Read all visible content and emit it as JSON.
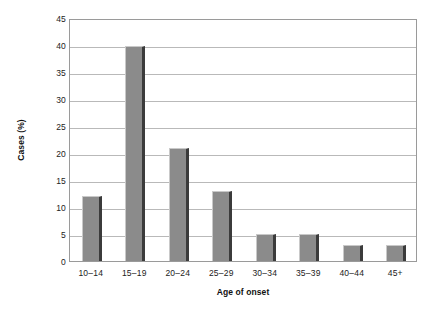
{
  "chart_data": {
    "type": "bar",
    "title": "",
    "subtitle": "",
    "xlabel": "Age of onset",
    "ylabel": "Cases (%)",
    "categories": [
      "10–14",
      "15–19",
      "20–24",
      "25–29",
      "30–34",
      "35–39",
      "40–44",
      "45+"
    ],
    "values": [
      12,
      39.8,
      21,
      13,
      5,
      5,
      3,
      3
    ],
    "series": [
      {
        "name": "Cases (%)",
        "values": [
          12,
          39.8,
          21,
          13,
          5,
          5,
          3,
          3
        ]
      }
    ],
    "ylim": [
      0,
      45
    ],
    "ytick_labels": [
      "0",
      "5",
      "10",
      "15",
      "20",
      "25",
      "30",
      "35",
      "40",
      "45"
    ],
    "ytick_values": [
      0,
      5,
      10,
      15,
      20,
      25,
      30,
      35,
      40,
      45
    ],
    "grid": "horizontal",
    "legend": "none",
    "annotations": [],
    "colors": {
      "bar_face": "#8b8b8b",
      "bar_shadow": "#3b3b3b",
      "bar_highlight": "#c9c9c9",
      "gridline": "#b9b9b9",
      "axis_border": "#9a9a9a",
      "text": "#222222",
      "background": "#ffffff"
    }
  }
}
